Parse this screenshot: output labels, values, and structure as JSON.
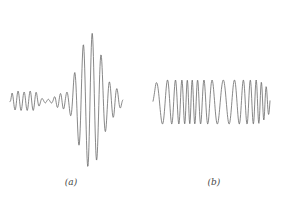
{
  "figure": {
    "background": "#ffffff",
    "waveform_stroke": "#6a6a6a",
    "label_color": "#474747"
  },
  "panels": [
    {
      "label": "(a)"
    },
    {
      "label": "(b)"
    }
  ],
  "chart_data": [
    {
      "type": "line",
      "panel": "a",
      "label": "(a)",
      "description": "oscillatory trace: small-amplitude onset, brief near-flat quiet interval, then a large-amplitude burst (wave packet) that decays",
      "x_start": 10,
      "x_end": 123,
      "center_y": 101,
      "phase0": -0.5,
      "sample_step": 0.3,
      "envelope": [
        [
          10,
          1
        ],
        [
          12,
          8
        ],
        [
          18,
          10
        ],
        [
          24,
          9
        ],
        [
          30,
          10
        ],
        [
          36,
          9
        ],
        [
          40,
          4
        ],
        [
          43,
          2
        ],
        [
          50,
          1.6
        ],
        [
          53,
          2.5
        ],
        [
          56,
          6
        ],
        [
          62,
          8
        ],
        [
          66,
          8
        ],
        [
          69,
          11
        ],
        [
          72,
          18
        ],
        [
          76,
          34
        ],
        [
          80,
          48
        ],
        [
          84,
          58
        ],
        [
          88,
          66
        ],
        [
          92,
          68
        ],
        [
          96,
          61
        ],
        [
          100,
          50
        ],
        [
          104,
          36
        ],
        [
          107,
          25
        ],
        [
          110,
          18
        ],
        [
          114,
          16
        ],
        [
          118,
          11
        ],
        [
          121,
          6
        ],
        [
          123,
          2
        ]
      ],
      "frequency": [
        [
          10,
          0.165
        ],
        [
          62,
          0.165
        ],
        [
          70,
          0.13
        ],
        [
          78,
          0.112
        ],
        [
          104,
          0.112
        ],
        [
          110,
          0.135
        ],
        [
          123,
          0.14
        ]
      ]
    },
    {
      "type": "line",
      "panel": "b",
      "label": "(b)",
      "description": "constant-amplitude oscillation whose frequency alternately compresses and stretches (frequency modulation)",
      "x_start": 153,
      "x_end": 270,
      "center_y": 102,
      "phase0": 0.1,
      "sample_step": 0.3,
      "envelope": [
        [
          153,
          8
        ],
        [
          156,
          19
        ],
        [
          159,
          22
        ],
        [
          258,
          22
        ],
        [
          264,
          18
        ],
        [
          270,
          11
        ]
      ],
      "frequency": [
        [
          153,
          0.07
        ],
        [
          160,
          0.08
        ],
        [
          175,
          0.14
        ],
        [
          190,
          0.21
        ],
        [
          202,
          0.15
        ],
        [
          214,
          0.095
        ],
        [
          222,
          0.08
        ],
        [
          236,
          0.1
        ],
        [
          248,
          0.15
        ],
        [
          258,
          0.19
        ],
        [
          264,
          0.21
        ],
        [
          270,
          0.2
        ]
      ]
    }
  ]
}
